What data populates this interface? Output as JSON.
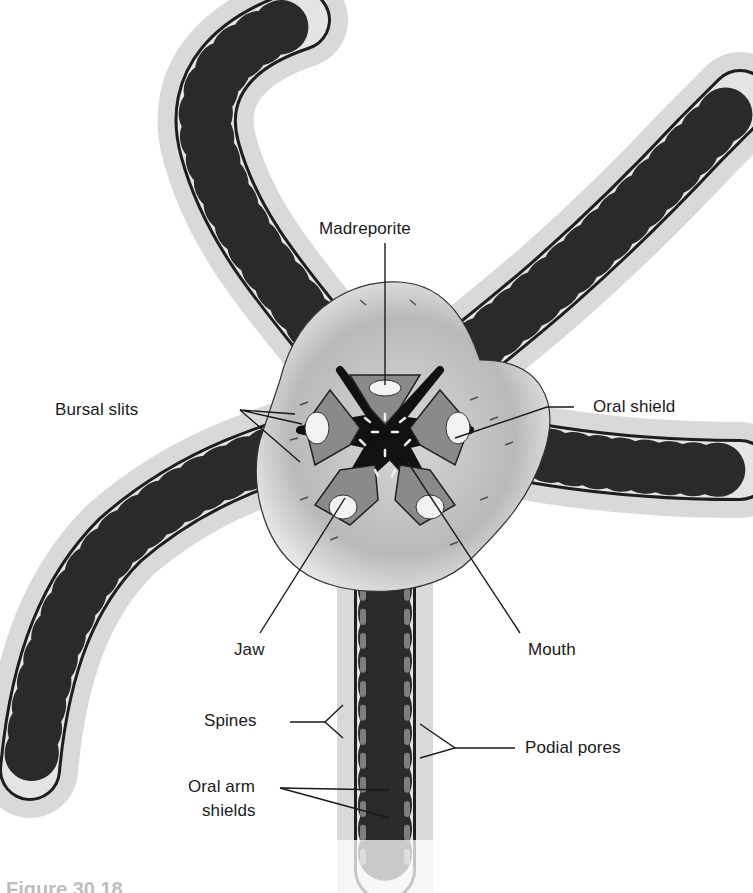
{
  "figure": {
    "caption": "Figure 30.18",
    "colors": {
      "background": "#ffffff",
      "arm_fill": "#e4e4e4",
      "arm_stroke": "#1e1e1e",
      "disc_fill": "#c9c9c9",
      "oral_shield_fill": "#8a8a8a",
      "mouth_fill": "#111111",
      "label_text": "#1a1a1a",
      "leader_line": "#1a1a1a"
    }
  },
  "labels": {
    "madreporite": "Madreporite",
    "bursal_slits": "Bursal slits",
    "oral_shield": "Oral shield",
    "jaw": "Jaw",
    "mouth": "Mouth",
    "spines": "Spines",
    "podial_pores": "Podial pores",
    "oral_arm_shields_1": "Oral arm",
    "oral_arm_shields_2": "shields"
  }
}
